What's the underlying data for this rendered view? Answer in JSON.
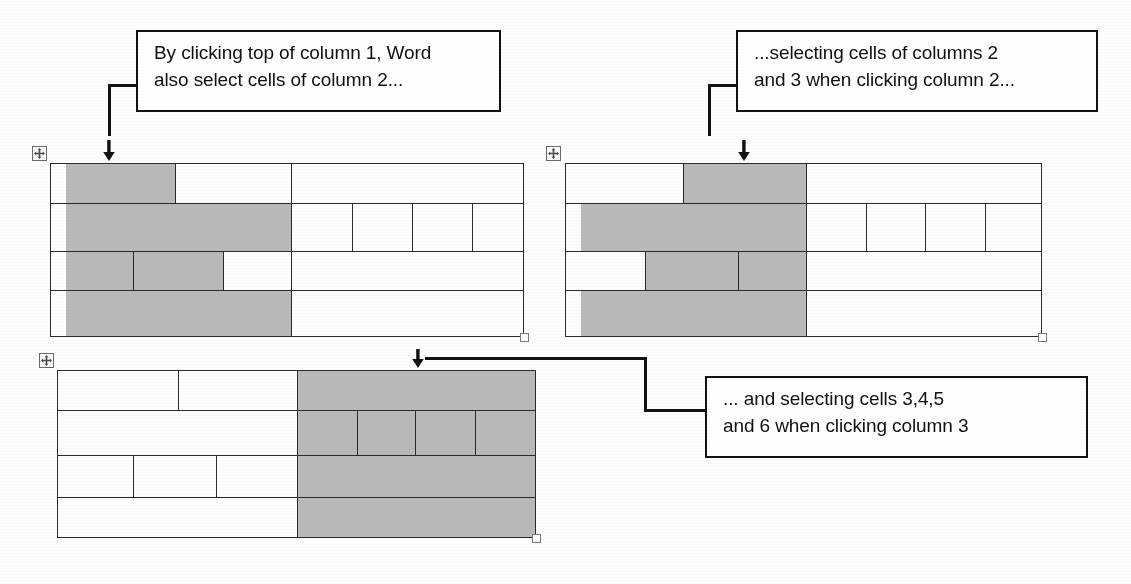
{
  "document": {
    "title": "Word table column selection behaviour",
    "background_color": "#fdfdfd",
    "ink_color": "#121212",
    "selection_fill_color": "#b9b9b9"
  },
  "callouts": [
    {
      "id": "callout-1",
      "text": "By clicking top of column 1, Word\nalso select cells of column 2...",
      "points_to": "table-1"
    },
    {
      "id": "callout-2",
      "text": "...selecting cells of columns 2\nand 3 when clicking column 2...",
      "points_to": "table-2"
    },
    {
      "id": "callout-3",
      "text": "... and selecting cells 3,4,5\nand 6 when clicking column 3",
      "points_to": "table-3"
    }
  ],
  "tables": [
    {
      "id": "table-1",
      "label": "table-column-1-selected",
      "move_handle": "table-move-handle",
      "resize_handle": "table-resize-handle",
      "arrow": "down-arrow",
      "selected_column": "1",
      "rows": 4,
      "description": "Leftmost band shaded across all four rows; row 1 shading stops early."
    },
    {
      "id": "table-2",
      "label": "table-column-2-selected",
      "move_handle": "table-move-handle",
      "resize_handle": "table-resize-handle",
      "arrow": "down-arrow",
      "selected_column": "2",
      "rows": 4,
      "description": "Middle band shaded; row 1 shading begins at mid divider."
    },
    {
      "id": "table-3",
      "label": "table-column-3-selected",
      "move_handle": "table-move-handle",
      "resize_handle": "table-resize-handle",
      "arrow": "down-arrow",
      "selected_column": "3",
      "rows": 4,
      "description": "Entire right band shaded across all rows including sub-cells."
    }
  ]
}
